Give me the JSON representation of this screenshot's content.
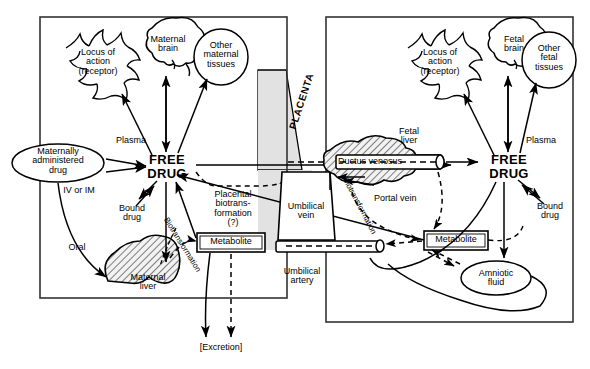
{
  "diagram": {
    "type": "flow-diagram",
    "compartments": {
      "maternal": {
        "name": "Maternal compartment",
        "free_drug": "FREE\nDRUG",
        "plasma": "Plasma",
        "bound_drug": "Bound\ndrug",
        "locus": "Locus of\naction\n(receptor)",
        "brain": "Maternal\nbrain",
        "other_tissues": "Other\nmaternal\ntissues",
        "liver": "Maternal\nliver",
        "metabolite": "Metabolite",
        "administered": "Maternally\nadministered\ndrug",
        "route_iv": "IV or IM",
        "route_oral": "Oral",
        "biotransformation": "Biotransformation"
      },
      "placenta": {
        "name": "PLACENTA",
        "biotransformation": "Placental\nbiotrans-\nformation\n(?)"
      },
      "fetal": {
        "name": "Fetal compartment",
        "free_drug": "FREE\nDRUG",
        "plasma": "Plasma",
        "bound_drug": "Bound\ndrug",
        "locus": "Locus of\naction\n(receptor)",
        "brain": "Fetal\nbrain",
        "other_tissues": "Other\nfetal\ntissues",
        "liver": "Fetal\nliver",
        "metabolite": "Metabolite",
        "amniotic": "Amniotic\nfluid",
        "ductus_venosus": "Ductus venosus",
        "portal_vein": "Portal vein",
        "umbilical_vein": "Umbilical\nvein",
        "umbilical_artery": "Umbilical\nartery",
        "biotransformation": "Biotransformation"
      },
      "excretion": "[Excretion]"
    },
    "colors": {
      "ink": "#000000",
      "placenta_fill": "#e2e2e2",
      "liver_fill": "#e8e8e8",
      "background": "#ffffff"
    }
  }
}
